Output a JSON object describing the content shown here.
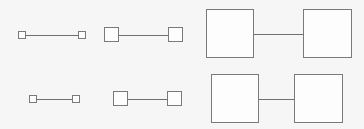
{
  "figure": {
    "type": "diagram",
    "background_color": "#f6f6f6",
    "node_fill_color": "#fdfdfd",
    "node_border_color": "#7a7a7a",
    "edge_color": "#6f6f6f",
    "width": 364,
    "height": 129,
    "rows": 2,
    "columns": 3
  },
  "pairs": [
    {
      "id": "pair-r1c1",
      "row": 1,
      "column": 1,
      "size_label": "small",
      "node_size": 8,
      "left_node": {
        "x": 18,
        "y": 31,
        "w": 8,
        "h": 8
      },
      "right_node": {
        "x": 78,
        "y": 31,
        "w": 8,
        "h": 8
      },
      "edge": {
        "x": 26,
        "y": 35,
        "length": 52
      }
    },
    {
      "id": "pair-r1c2",
      "row": 1,
      "column": 2,
      "size_label": "medium",
      "node_size": 15,
      "left_node": {
        "x": 104,
        "y": 27,
        "w": 15,
        "h": 15
      },
      "right_node": {
        "x": 168,
        "y": 27,
        "w": 15,
        "h": 15
      },
      "edge": {
        "x": 119,
        "y": 35,
        "length": 49
      }
    },
    {
      "id": "pair-r1c3",
      "row": 1,
      "column": 3,
      "size_label": "large",
      "node_size": 48,
      "left_node": {
        "x": 206,
        "y": 9,
        "w": 48,
        "h": 49
      },
      "right_node": {
        "x": 303,
        "y": 9,
        "w": 49,
        "h": 49
      },
      "edge": {
        "x": 254,
        "y": 34,
        "length": 49
      }
    },
    {
      "id": "pair-r2c1",
      "row": 2,
      "column": 1,
      "size_label": "small",
      "node_size": 8,
      "left_node": {
        "x": 29,
        "y": 95,
        "w": 8,
        "h": 8
      },
      "right_node": {
        "x": 72,
        "y": 95,
        "w": 8,
        "h": 8
      },
      "edge": {
        "x": 37,
        "y": 99,
        "length": 35
      }
    },
    {
      "id": "pair-r2c2",
      "row": 2,
      "column": 2,
      "size_label": "medium",
      "node_size": 15,
      "left_node": {
        "x": 113,
        "y": 91,
        "w": 15,
        "h": 15
      },
      "right_node": {
        "x": 167,
        "y": 91,
        "w": 15,
        "h": 15
      },
      "edge": {
        "x": 128,
        "y": 99,
        "length": 39
      }
    },
    {
      "id": "pair-r2c3",
      "row": 2,
      "column": 3,
      "size_label": "large",
      "node_size": 49,
      "left_node": {
        "x": 211,
        "y": 74,
        "w": 48,
        "h": 49
      },
      "right_node": {
        "x": 294,
        "y": 74,
        "w": 49,
        "h": 49
      },
      "edge": {
        "x": 259,
        "y": 99,
        "length": 35
      }
    }
  ]
}
